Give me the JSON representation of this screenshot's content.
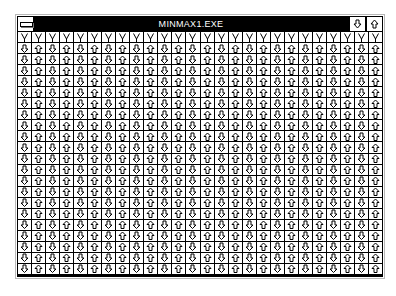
{
  "window": {
    "title": "MINMAX1.EXE",
    "system_menu_icon": "system-menu-icon",
    "minimize_icon": "arrow-down-icon",
    "maximize_icon": "arrow-up-icon"
  },
  "client": {
    "columns": 26,
    "rows": 22,
    "pattern": [
      "arrow-down-icon",
      "arrow-up-icon"
    ],
    "first_row_style": "v-shaped-arrow-tops"
  },
  "colors": {
    "titlebar": "#000000",
    "title_text": "#ffffff",
    "grid_lines": "#000000",
    "cell_bg": "#ffffff"
  }
}
